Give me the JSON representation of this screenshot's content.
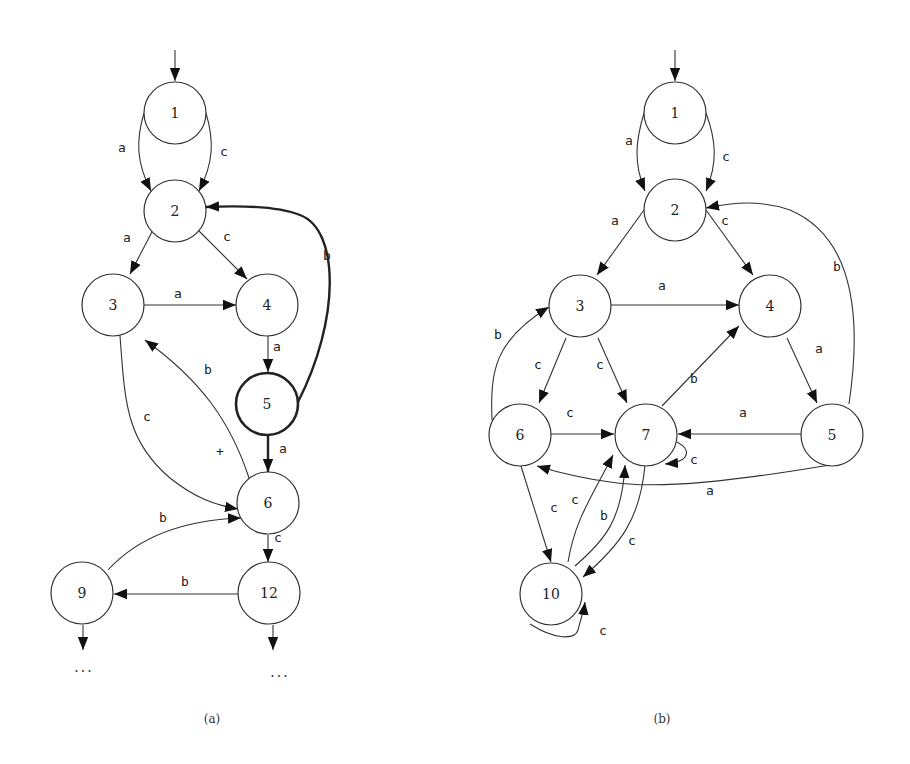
{
  "diagrams": [
    {
      "id": "a",
      "caption": "(a)",
      "nodes": [
        {
          "id": "1",
          "label": "1"
        },
        {
          "id": "2",
          "label": "2"
        },
        {
          "id": "3",
          "label": "3"
        },
        {
          "id": "4",
          "label": "4"
        },
        {
          "id": "5",
          "label": "5",
          "bold": true
        },
        {
          "id": "6",
          "label": "6"
        },
        {
          "id": "9",
          "label": "9"
        },
        {
          "id": "12",
          "label": "12"
        }
      ],
      "edges": [
        {
          "from": "start",
          "to": "1",
          "label": ""
        },
        {
          "from": "1",
          "to": "2",
          "label": "a"
        },
        {
          "from": "1",
          "to": "2",
          "label": "c"
        },
        {
          "from": "2",
          "to": "3",
          "label": "a"
        },
        {
          "from": "2",
          "to": "4",
          "label": "c"
        },
        {
          "from": "3",
          "to": "4",
          "label": "a"
        },
        {
          "from": "4",
          "to": "5",
          "label": "a"
        },
        {
          "from": "5",
          "to": "2",
          "label": "b",
          "bold": true
        },
        {
          "from": "5",
          "to": "6",
          "label": "a",
          "bold": true
        },
        {
          "from": "3",
          "to": "6",
          "label": "c"
        },
        {
          "from": "6",
          "to": "3",
          "label": "b"
        },
        {
          "from": "9",
          "to": "6",
          "label": "b"
        },
        {
          "from": "6",
          "to": "12",
          "label": "c"
        },
        {
          "from": "12",
          "to": "9",
          "label": "b"
        },
        {
          "from": "9",
          "to": "continuation",
          "label": ""
        },
        {
          "from": "12",
          "to": "continuation",
          "label": ""
        }
      ],
      "annotations": {
        "plus": "+",
        "ellipsis": "..."
      }
    },
    {
      "id": "b",
      "caption": "(b)",
      "nodes": [
        {
          "id": "1",
          "label": "1"
        },
        {
          "id": "2",
          "label": "2"
        },
        {
          "id": "3",
          "label": "3"
        },
        {
          "id": "4",
          "label": "4"
        },
        {
          "id": "5",
          "label": "5"
        },
        {
          "id": "6",
          "label": "6"
        },
        {
          "id": "7",
          "label": "7"
        },
        {
          "id": "10",
          "label": "10"
        }
      ],
      "edges": [
        {
          "from": "start",
          "to": "1",
          "label": ""
        },
        {
          "from": "1",
          "to": "2",
          "label": "a"
        },
        {
          "from": "1",
          "to": "2",
          "label": "c"
        },
        {
          "from": "2",
          "to": "3",
          "label": "a"
        },
        {
          "from": "2",
          "to": "4",
          "label": "c"
        },
        {
          "from": "3",
          "to": "4",
          "label": "a"
        },
        {
          "from": "4",
          "to": "5",
          "label": "a"
        },
        {
          "from": "5",
          "to": "2",
          "label": "b"
        },
        {
          "from": "3",
          "to": "6",
          "label": "c"
        },
        {
          "from": "3",
          "to": "7",
          "label": "c"
        },
        {
          "from": "6",
          "to": "3",
          "label": "b"
        },
        {
          "from": "6",
          "to": "7",
          "label": "c"
        },
        {
          "from": "7",
          "to": "4",
          "label": "b"
        },
        {
          "from": "5",
          "to": "7",
          "label": "a"
        },
        {
          "from": "7",
          "to": "7",
          "label": "c"
        },
        {
          "from": "5",
          "to": "6",
          "label": "a"
        },
        {
          "from": "6",
          "to": "10",
          "label": "c"
        },
        {
          "from": "10",
          "to": "7",
          "label": "c"
        },
        {
          "from": "10",
          "to": "7",
          "label": "b"
        },
        {
          "from": "7",
          "to": "10",
          "label": "c"
        },
        {
          "from": "10",
          "to": "10",
          "label": "c"
        }
      ]
    }
  ]
}
